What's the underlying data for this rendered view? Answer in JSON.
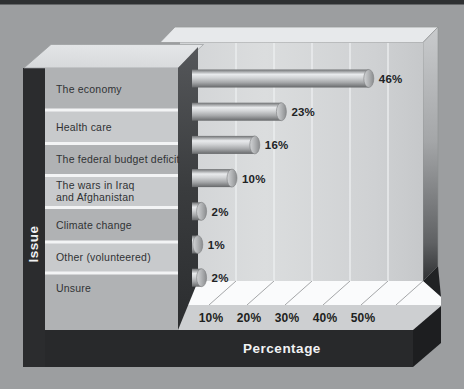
{
  "chart_data": {
    "type": "bar",
    "orientation": "horizontal",
    "title": "",
    "categories": [
      "The economy",
      "Health care",
      "The federal budget deficit",
      "The wars in Iraq and Afghanistan",
      "Climate change",
      "Other (volunteered)",
      "Unsure"
    ],
    "category_display_lines": [
      [
        "The economy"
      ],
      [
        "Health care"
      ],
      [
        "The federal budget deficit"
      ],
      [
        "The wars in Iraq",
        "and Afghanistan"
      ],
      [
        "Climate change"
      ],
      [
        "Other (volunteered)"
      ],
      [
        "Unsure"
      ]
    ],
    "values": [
      46,
      23,
      16,
      10,
      2,
      1,
      2
    ],
    "value_labels": [
      "46%",
      "23%",
      "16%",
      "10%",
      "2%",
      "1%",
      "2%"
    ],
    "x_ticks": [
      "0%",
      "10%",
      "20%",
      "30%",
      "40%",
      "50%"
    ],
    "x_tick_values": [
      0,
      10,
      20,
      30,
      40,
      50
    ],
    "xlim": [
      0,
      59
    ],
    "xlabel": "Percentage",
    "ylabel": "Issue",
    "legend_position": "none",
    "grid": "vertical gridlines every 10%",
    "style_note": "scanned textbook 3D gray cylinder bar chart"
  },
  "colors": {
    "background": "#9c9ea0",
    "top_strip": "#2e3032",
    "dark_slab": "#28292b",
    "dark_slab_side": "#1d1e20",
    "wall": "#d3d5d7",
    "wall_top": "#e7e9eb",
    "gridline": "#eceef0",
    "floor": "#fafbfc",
    "tick_band": "#cdcfd1",
    "band_medium": "#b0b2b4",
    "band_light": "#c8cacc",
    "band_separator": "#f3f4f5",
    "bar_highlight": "#e9ebed",
    "text_dark": "#212325",
    "text_light": "#f1f2f3"
  }
}
